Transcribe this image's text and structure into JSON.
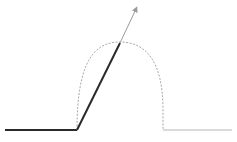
{
  "diagram": {
    "colors": {
      "background": "#ffffff",
      "dark_line": "#2a2a2a",
      "thin_line": "#9a9a9a",
      "dashed_arc": "#a8a8a8",
      "right_baseline": "#b5b5b5"
    },
    "elements": [
      {
        "name": "left-baseline",
        "from": [
          5,
          130
        ],
        "to": [
          77,
          130
        ]
      },
      {
        "name": "steep-segment",
        "from": [
          77,
          130
        ],
        "to": [
          120,
          43
        ]
      },
      {
        "name": "extension-arrow",
        "from": [
          120,
          43
        ],
        "to": [
          137,
          7
        ]
      },
      {
        "name": "dashed-arch",
        "start": [
          77,
          130
        ],
        "peak": [
          120,
          42
        ],
        "end": [
          163,
          130
        ]
      },
      {
        "name": "right-baseline",
        "from": [
          163,
          130
        ],
        "to": [
          232,
          130
        ]
      }
    ]
  }
}
